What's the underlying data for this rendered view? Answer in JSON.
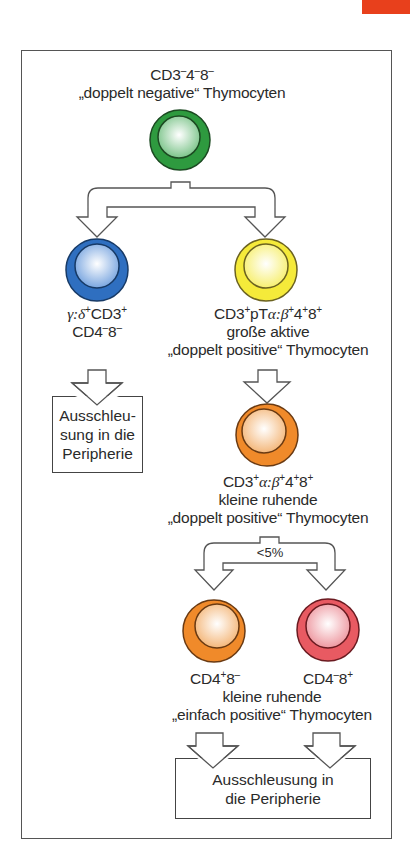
{
  "colors": {
    "accent_tab": "#e8401c",
    "green_cell": "#2e9a3f",
    "blue_cell": "#2f6fc0",
    "yellow_cell": "#f5ea3a",
    "orange_cell": "#f08a2a",
    "red_cell": "#e85a62"
  },
  "nodes": {
    "dn": {
      "line1": "CD3",
      "line1_sup1": "–",
      "line1_mid": "4",
      "line1_sup2": "–",
      "line1_end": "8",
      "line1_sup3": "–",
      "line2": "„doppelt negative“ Thymocyten"
    },
    "gd": {
      "line1_greek": "γ:δ",
      "line1_sup1": "+",
      "line1_mid": "CD3",
      "line1_sup2": "+",
      "line2": "CD4",
      "line2_sup1": "–",
      "line2_mid": "8",
      "line2_sup2": "–"
    },
    "dp_large": {
      "line1_a": "CD3",
      "line1_sup1": "+",
      "line1_b": "pT",
      "line1_greek": "α:β",
      "line1_sup2": "+",
      "line1_c": "4",
      "line1_sup3": "+",
      "line1_d": "8",
      "line1_sup4": "+",
      "line2": "große aktive",
      "line3": "„doppelt positive“ Thymocyten"
    },
    "dp_small": {
      "line1_a": "CD3",
      "line1_sup1": "+",
      "line1_greek": "α:β",
      "line1_sup2": "+",
      "line1_c": "4",
      "line1_sup3": "+",
      "line1_d": "8",
      "line1_sup4": "+",
      "line2": "kleine ruhende",
      "line3": "„doppelt positive“ Thymocyten"
    },
    "sp_cd4": {
      "a": "CD4",
      "sup1": "+",
      "b": "8",
      "sup2": "–"
    },
    "sp_cd8": {
      "a": "CD4",
      "sup1": "–",
      "b": "8",
      "sup2": "+"
    },
    "sp_caption": {
      "line1": "kleine ruhende",
      "line2": "„einfach positive“ Thymocyten"
    }
  },
  "boxes": {
    "left_exit": {
      "line1": "Ausschleu-",
      "line2": "sung in die",
      "line3": "Peripherie"
    },
    "bottom_exit": {
      "line1": "Ausschleusung in",
      "line2": "die Peripherie"
    }
  },
  "branch_labels": {
    "sp_selection": "<5%"
  }
}
